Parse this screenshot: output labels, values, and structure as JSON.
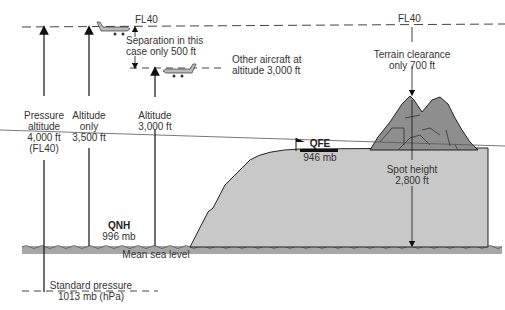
{
  "diagram": {
    "fl40_left": "FL40",
    "fl40_right": "FL40",
    "separation": [
      "Separation in this",
      "case only 500 ft"
    ],
    "other_aircraft": [
      "Other aircraft at",
      "altitude 3,000 ft"
    ],
    "terrain_clearance": [
      "Terrain clearance",
      "only 700 ft"
    ],
    "pressure_altitude": [
      "Pressure",
      "altitude",
      "4,000 ft",
      "(FL40)"
    ],
    "altitude_only": [
      "Altitude",
      "only",
      "3,500 ft"
    ],
    "altitude_3000": [
      "Altitude",
      "3,000 ft"
    ],
    "qfe": "QFE",
    "qfe_value": "946 mb",
    "spot_height": [
      "Spot height",
      "2,800 ft"
    ],
    "qnh": "QNH",
    "qnh_value": "996 mb",
    "msl": "Mean sea level",
    "std_pressure": [
      "Standard pressure",
      "1013 mb (hPa)"
    ]
  },
  "colors": {
    "terrain": "#c8c8c8",
    "mountain": "#8e8e8e",
    "sea": "#a6a6a6",
    "line": "#222222"
  }
}
